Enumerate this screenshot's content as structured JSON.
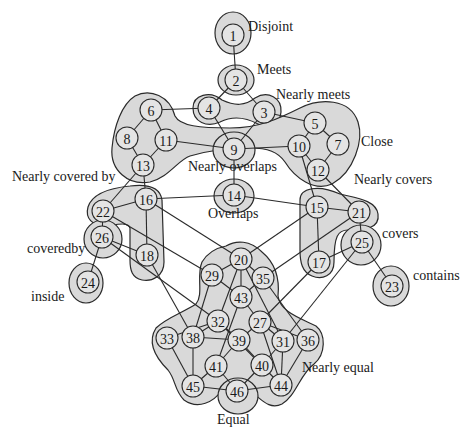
{
  "diagram": {
    "type": "conceptual-neighborhood-graph",
    "colors": {
      "region_fill": "#d9d9d9",
      "node_fill": "#e4e4e4",
      "stroke": "#2a2a2a",
      "background": "#ffffff"
    },
    "group_labels": [
      {
        "id": "disjoint",
        "text": "Disjoint",
        "x": 248,
        "y": 31
      },
      {
        "id": "meets",
        "text": "Meets",
        "x": 257,
        "y": 74
      },
      {
        "id": "nearly-meets",
        "text": "Nearly meets",
        "x": 276,
        "y": 99
      },
      {
        "id": "close",
        "text": "Close",
        "x": 361,
        "y": 146
      },
      {
        "id": "nearly-overlaps",
        "text": "Nearly overlaps",
        "x": 188,
        "y": 171
      },
      {
        "id": "nearly-covered-by",
        "text": "Nearly covered by",
        "x": 12,
        "y": 181
      },
      {
        "id": "nearly-covers",
        "text": "Nearly covers",
        "x": 354,
        "y": 184
      },
      {
        "id": "overlaps",
        "text": "Overlaps",
        "x": 208,
        "y": 218
      },
      {
        "id": "coveredby",
        "text": "coveredby",
        "x": 27,
        "y": 253
      },
      {
        "id": "covers",
        "text": "covers",
        "x": 382,
        "y": 238
      },
      {
        "id": "inside",
        "text": "inside",
        "x": 31,
        "y": 301
      },
      {
        "id": "contains",
        "text": "contains",
        "x": 413,
        "y": 280
      },
      {
        "id": "nearly-equal",
        "text": "Nearly equal",
        "x": 302,
        "y": 372
      },
      {
        "id": "equal",
        "text": "Equal",
        "x": 217,
        "y": 424
      }
    ],
    "nodes": [
      {
        "id": "1",
        "x": 233,
        "y": 35,
        "ring": true
      },
      {
        "id": "2",
        "x": 236,
        "y": 80,
        "ring": true
      },
      {
        "id": "3",
        "x": 264,
        "y": 112
      },
      {
        "id": "4",
        "x": 209,
        "y": 108
      },
      {
        "id": "5",
        "x": 315,
        "y": 123
      },
      {
        "id": "6",
        "x": 151,
        "y": 110
      },
      {
        "id": "7",
        "x": 338,
        "y": 144
      },
      {
        "id": "8",
        "x": 127,
        "y": 138
      },
      {
        "id": "9",
        "x": 234,
        "y": 149,
        "ring": true
      },
      {
        "id": "10",
        "x": 299,
        "y": 146
      },
      {
        "id": "11",
        "x": 166,
        "y": 140
      },
      {
        "id": "12",
        "x": 318,
        "y": 170
      },
      {
        "id": "13",
        "x": 143,
        "y": 165
      },
      {
        "id": "14",
        "x": 234,
        "y": 195,
        "ring": true
      },
      {
        "id": "15",
        "x": 317,
        "y": 207
      },
      {
        "id": "16",
        "x": 146,
        "y": 199
      },
      {
        "id": "17",
        "x": 319,
        "y": 262
      },
      {
        "id": "18",
        "x": 147,
        "y": 255
      },
      {
        "id": "20",
        "x": 241,
        "y": 259
      },
      {
        "id": "21",
        "x": 359,
        "y": 212
      },
      {
        "id": "22",
        "x": 103,
        "y": 211
      },
      {
        "id": "23",
        "x": 392,
        "y": 286,
        "ring": true
      },
      {
        "id": "24",
        "x": 88,
        "y": 282,
        "ring": true
      },
      {
        "id": "25",
        "x": 362,
        "y": 242
      },
      {
        "id": "26",
        "x": 102,
        "y": 237
      },
      {
        "id": "27",
        "x": 260,
        "y": 322
      },
      {
        "id": "29",
        "x": 212,
        "y": 275
      },
      {
        "id": "31",
        "x": 283,
        "y": 341
      },
      {
        "id": "32",
        "x": 218,
        "y": 321
      },
      {
        "id": "33",
        "x": 167,
        "y": 338
      },
      {
        "id": "35",
        "x": 263,
        "y": 278
      },
      {
        "id": "36",
        "x": 308,
        "y": 340
      },
      {
        "id": "38",
        "x": 193,
        "y": 337
      },
      {
        "id": "39",
        "x": 239,
        "y": 340
      },
      {
        "id": "40",
        "x": 262,
        "y": 365
      },
      {
        "id": "41",
        "x": 216,
        "y": 366
      },
      {
        "id": "43",
        "x": 241,
        "y": 297
      },
      {
        "id": "44",
        "x": 281,
        "y": 385
      },
      {
        "id": "45",
        "x": 193,
        "y": 386
      },
      {
        "id": "46",
        "x": 237,
        "y": 391,
        "ring": true
      }
    ],
    "edges": [
      [
        "1",
        "2"
      ],
      [
        "2",
        "4"
      ],
      [
        "2",
        "3"
      ],
      [
        "4",
        "6"
      ],
      [
        "4",
        "9"
      ],
      [
        "3",
        "9"
      ],
      [
        "3",
        "5"
      ],
      [
        "6",
        "8"
      ],
      [
        "6",
        "11"
      ],
      [
        "8",
        "13"
      ],
      [
        "11",
        "13"
      ],
      [
        "11",
        "9"
      ],
      [
        "9",
        "10"
      ],
      [
        "9",
        "14"
      ],
      [
        "5",
        "10"
      ],
      [
        "5",
        "7"
      ],
      [
        "10",
        "12"
      ],
      [
        "7",
        "12"
      ],
      [
        "13",
        "22"
      ],
      [
        "13",
        "16"
      ],
      [
        "12",
        "21"
      ],
      [
        "10",
        "15"
      ],
      [
        "14",
        "16"
      ],
      [
        "14",
        "15"
      ],
      [
        "16",
        "22"
      ],
      [
        "16",
        "18"
      ],
      [
        "22",
        "26"
      ],
      [
        "26",
        "18"
      ],
      [
        "26",
        "24"
      ],
      [
        "15",
        "21"
      ],
      [
        "15",
        "17"
      ],
      [
        "21",
        "25"
      ],
      [
        "25",
        "17"
      ],
      [
        "25",
        "23"
      ],
      [
        "16",
        "20"
      ],
      [
        "22",
        "29"
      ],
      [
        "26",
        "32"
      ],
      [
        "18",
        "38"
      ],
      [
        "15",
        "20"
      ],
      [
        "21",
        "35"
      ],
      [
        "17",
        "27"
      ],
      [
        "25",
        "31"
      ],
      [
        "20",
        "29"
      ],
      [
        "20",
        "35"
      ],
      [
        "20",
        "43"
      ],
      [
        "20",
        "32"
      ],
      [
        "20",
        "31"
      ],
      [
        "29",
        "43"
      ],
      [
        "29",
        "38"
      ],
      [
        "35",
        "43"
      ],
      [
        "35",
        "36"
      ],
      [
        "43",
        "27"
      ],
      [
        "43",
        "41"
      ],
      [
        "32",
        "33"
      ],
      [
        "32",
        "38"
      ],
      [
        "32",
        "39"
      ],
      [
        "27",
        "39"
      ],
      [
        "27",
        "31"
      ],
      [
        "27",
        "36"
      ],
      [
        "27",
        "44"
      ],
      [
        "33",
        "45"
      ],
      [
        "38",
        "45"
      ],
      [
        "41",
        "45"
      ],
      [
        "41",
        "46"
      ],
      [
        "32",
        "44"
      ],
      [
        "31",
        "44"
      ],
      [
        "31",
        "40"
      ],
      [
        "36",
        "44"
      ],
      [
        "40",
        "46"
      ],
      [
        "45",
        "46"
      ],
      [
        "44",
        "46"
      ],
      [
        "38",
        "39"
      ],
      [
        "39",
        "41"
      ],
      [
        "39",
        "40"
      ]
    ]
  }
}
